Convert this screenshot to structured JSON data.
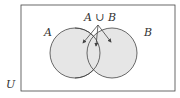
{
  "diagram": {
    "universe_label": "U",
    "set_a_label": "A",
    "set_b_label": "B",
    "union_label": "A ∪ B",
    "shading_color": "#e6e6e6",
    "stroke_color": "#444444"
  }
}
